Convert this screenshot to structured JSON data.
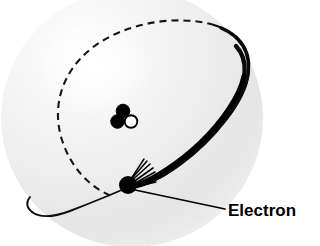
{
  "figure": {
    "background_color": "#ffffff",
    "width": 320,
    "height": 246
  },
  "sphere": {
    "name": "electron-cloud-sphere",
    "description": "shaded grey sphere representing the atom / electron cloud",
    "center_x": 132,
    "center_y": 118,
    "radius_x": 130,
    "radius_y": 128,
    "highlight_x": 95,
    "highlight_y": 70,
    "color_light": "#fbfbfb",
    "color_mid": "#ececec",
    "color_edge": "#d8d8d8"
  },
  "nucleus": {
    "name": "nucleus",
    "label": "",
    "center_x": 126,
    "center_y": 117,
    "particles": [
      {
        "name": "nucleon-top",
        "cx": 123,
        "cy": 111,
        "r": 6.6,
        "fill": "#000000",
        "stroke": "#000000"
      },
      {
        "name": "nucleon-left",
        "cx": 118,
        "cy": 121,
        "r": 6.6,
        "fill": "#000000",
        "stroke": "#000000"
      },
      {
        "name": "nucleon-right-open",
        "cx": 131,
        "cy": 121,
        "r": 6.2,
        "fill": "#ffffff",
        "stroke": "#000000"
      }
    ]
  },
  "orbit": {
    "name": "electron-orbit",
    "description": "tilted elliptical orbit path; dashed where it passes behind the sphere, solid where it passes in front",
    "line_color": "#000000",
    "dashed_segment": {
      "visible": true,
      "style": "dashed",
      "dash_pattern": "7 5",
      "stroke_width": 2.0
    },
    "solid_segment": {
      "visible": true,
      "style": "solid",
      "stroke_width_max": 5.0,
      "stroke_width_min": 1.6
    }
  },
  "electron": {
    "name": "electron-particle",
    "cx": 128,
    "cy": 185,
    "r": 9,
    "fill": "#000000",
    "motion_lines": {
      "name": "motion-streak-lines",
      "count": 7,
      "color": "#000000"
    }
  },
  "callout": {
    "name": "electron-callout",
    "label": "Electron",
    "text_x": 228,
    "text_y": 215,
    "leader_line": {
      "name": "leader-line",
      "from_x": 136,
      "from_y": 190,
      "to_x": 224,
      "to_y": 209,
      "color": "#000000",
      "stroke_width": 1.6
    }
  }
}
